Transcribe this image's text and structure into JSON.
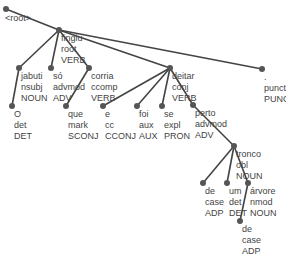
{
  "diagram": {
    "type": "dependency-tree",
    "edge_color": "#444444",
    "node_color": "#555555",
    "nodes": [
      {
        "id": "root",
        "word": "<root>",
        "rel": "",
        "pos": "",
        "x": 6,
        "y": 9,
        "parent": null
      },
      {
        "id": "fingiu",
        "word": "fingiu",
        "rel": "root",
        "pos": "VERB",
        "x": 59,
        "y": 30,
        "parent": "root"
      },
      {
        "id": "jabuti",
        "word": "jabuti",
        "rel": "nsubj",
        "pos": "NOUN",
        "x": 19,
        "y": 68,
        "parent": "fingiu"
      },
      {
        "id": "so",
        "word": "só",
        "rel": "advmod",
        "pos": "ADV",
        "x": 51,
        "y": 68,
        "parent": "fingiu"
      },
      {
        "id": "corria",
        "word": "corria",
        "rel": "ccomp",
        "pos": "VERB",
        "x": 89,
        "y": 68,
        "parent": "fingiu"
      },
      {
        "id": "deitar",
        "word": "deitar",
        "rel": "conj",
        "pos": "VERB",
        "x": 170,
        "y": 68,
        "parent": "fingiu"
      },
      {
        "id": "punct",
        "word": ".",
        "rel": "punct",
        "pos": "PUNCT",
        "x": 262,
        "y": 69,
        "parent": "fingiu"
      },
      {
        "id": "O",
        "word": "O",
        "rel": "det",
        "pos": "DET",
        "x": 12,
        "y": 106,
        "parent": "jabuti"
      },
      {
        "id": "que",
        "word": "que",
        "rel": "mark",
        "pos": "SCONJ",
        "x": 66,
        "y": 106,
        "parent": "corria"
      },
      {
        "id": "e",
        "word": "e",
        "rel": "cc",
        "pos": "CCONJ",
        "x": 103,
        "y": 106,
        "parent": "deitar"
      },
      {
        "id": "foi",
        "word": "foi",
        "rel": "aux",
        "pos": "AUX",
        "x": 137,
        "y": 106,
        "parent": "deitar"
      },
      {
        "id": "se",
        "word": "se",
        "rel": "expl",
        "pos": "PRON",
        "x": 162,
        "y": 106,
        "parent": "deitar"
      },
      {
        "id": "perto",
        "word": "perto",
        "rel": "advmod",
        "pos": "ADV",
        "x": 193,
        "y": 105,
        "parent": "deitar"
      },
      {
        "id": "tronco",
        "word": "tronco",
        "rel": "obl",
        "pos": "NOUN",
        "x": 234,
        "y": 146,
        "parent": "perto"
      },
      {
        "id": "de1",
        "word": "de",
        "rel": "case",
        "pos": "ADP",
        "x": 203,
        "y": 183,
        "parent": "tronco"
      },
      {
        "id": "um",
        "word": "um",
        "rel": "det",
        "pos": "DET",
        "x": 227,
        "y": 183,
        "parent": "tronco"
      },
      {
        "id": "arvore",
        "word": "árvore",
        "rel": "nmod",
        "pos": "NOUN",
        "x": 248,
        "y": 183,
        "parent": "tronco"
      },
      {
        "id": "de2",
        "word": "de",
        "rel": "case",
        "pos": "ADP",
        "x": 240,
        "y": 221,
        "parent": "arvore"
      }
    ]
  }
}
